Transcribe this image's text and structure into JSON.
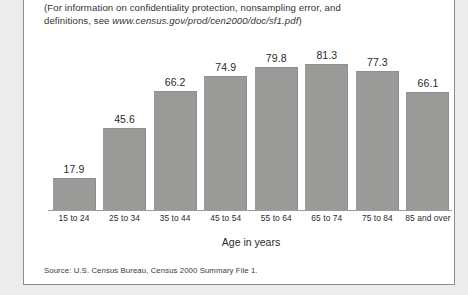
{
  "note": {
    "line1_pre": "(For information on confidentiality protection, nonsampling error, and",
    "line2_pre": "definitions, see ",
    "url": "www.census.gov/prod/cen2000/doc/sf1.pdf",
    "line2_post": ")"
  },
  "source": "Source: U.S. Census Bureau, Census 2000 Summary File 1.",
  "colors": {
    "bar_fill": "#9a9a99",
    "page_background": "#ffffff",
    "outer_background": "#ececed",
    "axis_line": "#9b9b9b",
    "text": "#2b2b2b"
  },
  "chart_data": {
    "type": "bar",
    "title": "",
    "xlabel": "Age in years",
    "ylabel": "",
    "categories": [
      "15 to 24",
      "25 to 34",
      "35 to 44",
      "45 to 54",
      "55 to 64",
      "65 to 74",
      "75 to 84",
      "85 and over"
    ],
    "values": [
      17.9,
      45.6,
      66.2,
      74.9,
      79.8,
      81.3,
      77.3,
      66.1
    ],
    "value_labels": [
      "17.9",
      "45.6",
      "66.2",
      "74.9",
      "79.8",
      "81.3",
      "77.3",
      "66.1"
    ],
    "ylim": [
      0,
      101
    ],
    "grid": false,
    "legend": null
  }
}
